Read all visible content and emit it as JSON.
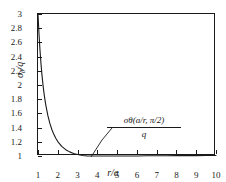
{
  "chart_data": {
    "type": "line",
    "title": "",
    "xlabel": "r/a",
    "ylabel": "σθ/q",
    "xlim": [
      1,
      10
    ],
    "ylim": [
      1,
      3
    ],
    "grid": false,
    "legend": "none",
    "xticks": [
      "1",
      "2",
      "3",
      "4",
      "5",
      "6",
      "7",
      "8",
      "9",
      "10"
    ],
    "xtick_values": [
      1,
      2,
      3,
      4,
      5,
      6,
      7,
      8,
      9,
      10
    ],
    "yticks": [
      "1",
      "1.2",
      "1.4",
      "1.6",
      "1.8",
      "2",
      "2.2",
      "2.4",
      "2.6",
      "2.8",
      "3"
    ],
    "ytick_values": [
      1,
      1.2,
      1.4,
      1.6,
      1.8,
      2,
      2.2,
      2.4,
      2.6,
      2.8,
      3
    ],
    "annotations": [
      {
        "numerator": "σθ(a/r, π/2)",
        "denominator": "q",
        "style": "fraction-with-leader-line",
        "points_to": "curve"
      }
    ],
    "series": [
      {
        "name": "σθ(a/r, π/2)/q",
        "color": "#1a1a1a",
        "x": [
          1.0,
          1.05,
          1.1,
          1.15,
          1.2,
          1.25,
          1.3,
          1.35,
          1.4,
          1.5,
          1.6,
          1.7,
          1.8,
          1.9,
          2.0,
          2.2,
          2.4,
          2.6,
          2.8,
          3.0,
          3.25,
          3.5,
          3.75,
          4.0,
          4.5,
          5.0,
          5.5,
          6.0,
          6.5,
          7.0,
          7.5,
          8.0,
          8.5,
          9.0,
          9.5,
          10.0
        ],
        "y": [
          3.0,
          2.721,
          2.492,
          2.302,
          2.142,
          2.008,
          1.893,
          1.794,
          1.709,
          1.568,
          1.459,
          1.373,
          1.305,
          1.249,
          1.203,
          1.135,
          1.089,
          1.058,
          1.036,
          1.021,
          1.008,
          1.0,
          0.996,
          0.994,
          0.994,
          0.997,
          0.999,
          1.001,
          1.003,
          1.004,
          1.004,
          1.005,
          1.005,
          1.005,
          1.006,
          1.006
        ],
        "y_clamped_min": 1.0,
        "note": "hoop stress decays from 3 at r/a=1 asymptotically to 1"
      }
    ]
  },
  "axis_titles": {
    "y_main": "σ",
    "y_sub": "θ",
    "y_rest": "/q",
    "x": "r/a"
  },
  "colors": {
    "curve": "#1a1a1a",
    "axis": "#1a1a1a",
    "background": "#ffffff"
  }
}
